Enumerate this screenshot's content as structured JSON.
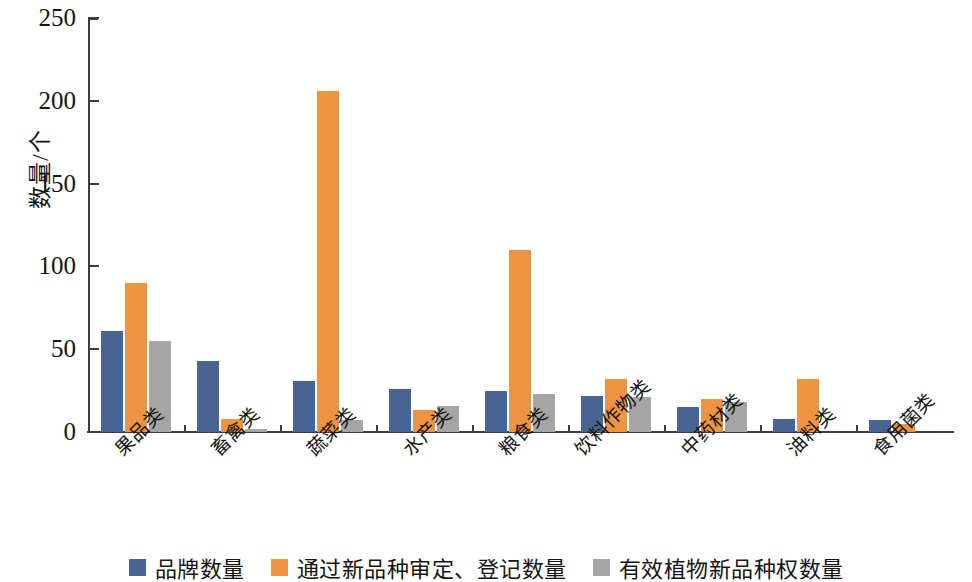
{
  "chart_data": {
    "type": "bar",
    "title": "",
    "xlabel": "",
    "ylabel": "数量/个",
    "ylim": [
      0,
      250
    ],
    "yticks": [
      0,
      50,
      100,
      150,
      200,
      250
    ],
    "grid": false,
    "legend_position": "bottom",
    "categories": [
      "果品类",
      "畜禽类",
      "蔬菜类",
      "水产类",
      "粮食类",
      "饮料作物类",
      "中药材类",
      "油料类",
      "食用菌类"
    ],
    "series": [
      {
        "name": "品牌数量",
        "color": "#4a6491",
        "values": [
          61,
          43,
          31,
          26,
          25,
          22,
          15,
          8,
          7
        ]
      },
      {
        "name": "通过新品种审定、登记数量",
        "color": "#ed9342",
        "values": [
          90,
          8,
          206,
          13,
          110,
          32,
          20,
          32,
          5
        ]
      },
      {
        "name": "有效植物新品种权数量",
        "color": "#a5a5a5",
        "values": [
          55,
          2,
          7,
          16,
          23,
          21,
          18,
          0,
          0
        ]
      }
    ]
  },
  "axis": {
    "y_label": "数量/个",
    "tick_labels": [
      "250",
      "200",
      "150",
      "100",
      "50",
      "0"
    ]
  },
  "colors": {
    "series0": "#4a6491",
    "series1": "#ed9342",
    "series2": "#a5a5a5",
    "axis": "#3b3b4a"
  }
}
